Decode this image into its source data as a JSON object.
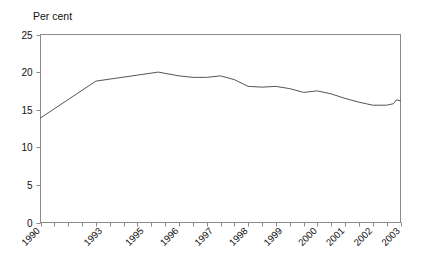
{
  "chart_data": {
    "type": "line",
    "title": "",
    "subtitle": "",
    "xlabel": "",
    "ylabel": "Per cent",
    "ylim": [
      0,
      25
    ],
    "yticks": [
      0,
      5,
      10,
      15,
      20,
      25
    ],
    "ytick_labels": [
      "0",
      "5",
      "10",
      "15",
      "20",
      "25"
    ],
    "grid": false,
    "legend": "none",
    "xlim": [
      1990.25,
      2003.25
    ],
    "xtick_labels": [
      "1990",
      "1993",
      "1995",
      "1996",
      "1997",
      "1998",
      "1999",
      "2000",
      "2001",
      "2002",
      "2003"
    ],
    "xtick_values": [
      1990.25,
      1992.5,
      1994.0,
      1995.25,
      1996.5,
      1997.75,
      1999.0,
      2000.25,
      2001.25,
      2002.25,
      2003.25
    ],
    "series": [
      {
        "name": "Per cent",
        "x": [
          1990.25,
          1992.25,
          1993.0,
          1993.75,
          1994.5,
          1995.25,
          1995.75,
          1996.25,
          1996.75,
          1997.25,
          1997.75,
          1998.25,
          1998.75,
          1999.25,
          1999.75,
          2000.25,
          2000.75,
          2001.25,
          2001.75,
          2002.25,
          2002.75,
          2003.0
        ],
        "values": [
          13.9,
          18.8,
          19.2,
          19.6,
          20.0,
          19.5,
          19.3,
          19.3,
          19.5,
          19.0,
          18.1,
          18.0,
          18.1,
          17.8,
          17.3,
          17.5,
          17.1,
          16.5,
          16.0,
          15.6,
          15.6,
          15.8
        ]
      }
    ],
    "series_end": {
      "x": 2003.25,
      "value": 16.2
    },
    "series_tail": {
      "x": [
        2003.0,
        2003.1,
        2003.25
      ],
      "values": [
        16.1,
        16.3,
        16.2
      ]
    }
  },
  "axes": {
    "frame_color": "#8a8a8a",
    "line_color": "#555555",
    "tick_color": "#8a8a8a"
  }
}
